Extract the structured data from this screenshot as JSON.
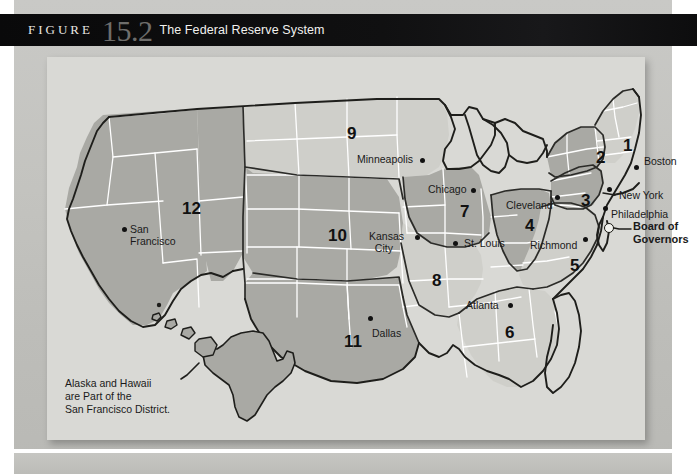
{
  "figure": {
    "label": "FIGURE",
    "number": "15.2",
    "title": "The Federal Reserve System"
  },
  "map": {
    "note": "Alaska and Hawaii\nare Part of the\nSan Francisco District.",
    "board_label": "Board of\nGovernors",
    "colors": {
      "panel_bg": "#d9d9d5",
      "district_light": "#cfcfca",
      "district_dark": "#a9a9a4",
      "state_border": "#ffffff",
      "district_border": "#2b2b28",
      "text": "#1a1a1a",
      "header_bg": "#0d0d0e",
      "header_number": "#6e6d6b"
    },
    "districts": [
      {
        "number": "1",
        "bank": "Boston",
        "shade": "light",
        "num_x": 576,
        "num_y": 88,
        "label_x": 597,
        "label_y": 104,
        "dot_x": 589,
        "dot_y": 112
      },
      {
        "number": "2",
        "bank": "New York",
        "shade": "dark",
        "num_x": 549,
        "num_y": 100,
        "label_x": 578,
        "label_y": 139,
        "dot_x": 566,
        "dot_y": 135
      },
      {
        "number": "3",
        "bank": "Philadelphia",
        "shade": "dark",
        "num_x": 534,
        "num_y": 143,
        "label_x": 566,
        "label_y": 157,
        "dot_x": 559,
        "dot_y": 155
      },
      {
        "number": "4",
        "bank": "Cleveland",
        "shade": "dark",
        "num_x": 482,
        "num_y": 168,
        "label_x": 466,
        "label_y": 150,
        "dot_x": 511,
        "dot_y": 146
      },
      {
        "number": "5",
        "bank": "Richmond",
        "shade": "light",
        "num_x": 527,
        "num_y": 208,
        "label_x": 487,
        "label_y": 190,
        "dot_x": 539,
        "dot_y": 186
      },
      {
        "number": "6",
        "bank": "Atlanta",
        "shade": "light",
        "num_x": 462,
        "num_y": 275,
        "label_x": 424,
        "label_y": 250,
        "dot_x": 478,
        "dot_y": 248
      },
      {
        "number": "7",
        "bank": "Chicago",
        "shade": "dark",
        "num_x": 417,
        "num_y": 154,
        "label_x": 385,
        "label_y": 133,
        "dot_x": 436,
        "dot_y": 137
      },
      {
        "number": "8",
        "bank": "St. Louis",
        "shade": "light",
        "num_x": 389,
        "num_y": 223,
        "label_x": 419,
        "label_y": 187,
        "dot_x": 409,
        "dot_y": 186
      },
      {
        "number": "9",
        "bank": "Minneapolis",
        "shade": "light",
        "num_x": 304,
        "num_y": 76,
        "label_x": 313,
        "label_y": 103,
        "dot_x": 375,
        "dot_y": 107
      },
      {
        "number": "10",
        "bank": "Kansas City",
        "shade": "dark",
        "num_x": 287,
        "num_y": 178,
        "label_x": 326,
        "label_y": 180,
        "dot_x": 371,
        "dot_y": 185
      },
      {
        "number": "11",
        "bank": "Dallas",
        "shade": "dark",
        "num_x": 303,
        "num_y": 284,
        "label_x": 327,
        "label_y": 277,
        "dot_x": 323,
        "dot_y": 266
      },
      {
        "number": "12",
        "bank": "San Francisco",
        "shade": "dark",
        "num_x": 141,
        "num_y": 151,
        "label_x": 87,
        "label_y": 173,
        "dot_x": 80,
        "dot_y": 175
      }
    ],
    "city_labels": [
      {
        "name": "Boston",
        "text": "Boston"
      },
      {
        "name": "New York",
        "text": "New York"
      },
      {
        "name": "Philadelphia",
        "text": "Philadelphia"
      },
      {
        "name": "Cleveland",
        "text": "Cleveland"
      },
      {
        "name": "Richmond",
        "text": "Richmond"
      },
      {
        "name": "Atlanta",
        "text": "Atlanta"
      },
      {
        "name": "Chicago",
        "text": "Chicago"
      },
      {
        "name": "St. Louis",
        "text": "St. Louis"
      },
      {
        "name": "Minneapolis",
        "text": "Minneapolis"
      },
      {
        "name": "Kansas City",
        "text": "Kansas\n  City"
      },
      {
        "name": "Dallas",
        "text": "Dallas"
      },
      {
        "name": "San Francisco",
        "text": "San\nFrancisco"
      }
    ]
  }
}
